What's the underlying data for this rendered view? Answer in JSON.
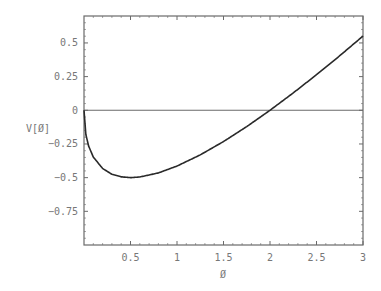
{
  "chart_data": {
    "type": "line",
    "title": "",
    "xlabel": "Ø",
    "ylabel": "V[Ø]",
    "xlim": [
      0,
      3
    ],
    "ylim": [
      -1.0,
      0.7
    ],
    "grid": false,
    "legend": null,
    "x_ticks": [
      0.5,
      1,
      1.5,
      2,
      2.5,
      3
    ],
    "x_tick_labels": [
      "0.5",
      "1",
      "1.5",
      "2",
      "2.5",
      "3"
    ],
    "y_ticks": [
      0.5,
      0.25,
      0,
      -0.25,
      -0.5,
      -0.75
    ],
    "y_tick_labels": [
      "0.5",
      "0.25",
      "0",
      "-0.25",
      "-0.5",
      "-0.75"
    ],
    "reference_line": {
      "y": 0,
      "description": "horizontal zero line"
    },
    "series": [
      {
        "name": "V[Ø]",
        "description": "V(Ø) = Ø − sqrt(2Ø); minimum -0.5 at Ø=0.5, root at Ø=2",
        "x": [
          0,
          0.02,
          0.05,
          0.1,
          0.2,
          0.3,
          0.4,
          0.5,
          0.6,
          0.8,
          1.0,
          1.25,
          1.5,
          1.75,
          2.0,
          2.25,
          2.5,
          2.75,
          3.0
        ],
        "values": [
          0,
          -0.18,
          -0.266,
          -0.347,
          -0.432,
          -0.475,
          -0.494,
          -0.5,
          -0.495,
          -0.465,
          -0.414,
          -0.331,
          -0.232,
          -0.121,
          0,
          0.129,
          0.264,
          0.405,
          0.551
        ]
      }
    ],
    "colors": {
      "curve": "#2a2a2a",
      "axes": "#6a6a6a",
      "text": "#777777"
    }
  }
}
